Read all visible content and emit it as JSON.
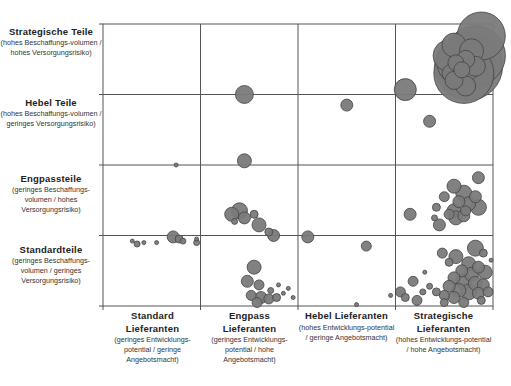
{
  "chart_data": {
    "type": "scatter",
    "subtype": "bubble-portfolio-matrix",
    "title": "",
    "xlabel": "Lieferanten-Portfolio (Entwicklungspotential / Angebotsmacht)",
    "ylabel": "Teile-Portfolio (Beschaffungsvolumen / Versorgungsrisiko)",
    "grid": true,
    "x_categories": [
      {
        "title": "Standard Lieferanten",
        "subtitle": "(geringes Entwicklungs-potential / geringe Angebotsmacht)"
      },
      {
        "title": "Engpass Lieferanten",
        "subtitle": "(geringes Entwicklungs-potential / hohe Angebotsmacht)"
      },
      {
        "title": "Hebel Lieferanten",
        "subtitle": "(hohes Entwicklungs-potential / geringe Angebotsmacht)"
      },
      {
        "title": "Strategische Lieferanten",
        "subtitle": "(hohes Entwicklungs-potential / hohe Angebotsmacht)"
      }
    ],
    "y_categories": [
      {
        "title": "Strategische Teile",
        "subtitle": "(hohes Beschaffungs-volumen / hohes Versorgungsrisiko)"
      },
      {
        "title": "Hebel Teile",
        "subtitle": "(hohes Beschaffungs-volumen / geringes Versorgungsrisiko)"
      },
      {
        "title": "Engpassteile",
        "subtitle": "(geringes Beschaffungs-volumen / hohes Versorgungsrisiko)"
      },
      {
        "title": "Standardteile",
        "subtitle": "(geringes Beschaffungs-volumen / geringes Versorgungsrisiko)"
      }
    ],
    "xlim": [
      0,
      4
    ],
    "ylim": [
      0,
      4
    ],
    "bubble_color": "#7a7a7a",
    "bubble_stroke": "#444444",
    "note": "x,y in plot units (0-4, each cell = 1 unit; y=4 top). r = radius in px.",
    "points": [
      {
        "x": 3.88,
        "y": 3.83,
        "r": 24
      },
      {
        "x": 3.82,
        "y": 3.55,
        "r": 30
      },
      {
        "x": 3.75,
        "y": 3.4,
        "r": 34
      },
      {
        "x": 3.7,
        "y": 3.3,
        "r": 30
      },
      {
        "x": 3.65,
        "y": 3.45,
        "r": 22
      },
      {
        "x": 3.55,
        "y": 3.55,
        "r": 16
      },
      {
        "x": 3.6,
        "y": 3.7,
        "r": 12
      },
      {
        "x": 3.78,
        "y": 3.62,
        "r": 12
      },
      {
        "x": 3.72,
        "y": 3.5,
        "r": 9
      },
      {
        "x": 3.62,
        "y": 3.45,
        "r": 8
      },
      {
        "x": 3.68,
        "y": 3.35,
        "r": 8
      },
      {
        "x": 3.57,
        "y": 3.3,
        "r": 9
      },
      {
        "x": 3.82,
        "y": 3.4,
        "r": 10
      },
      {
        "x": 3.6,
        "y": 3.2,
        "r": 9
      },
      {
        "x": 3.72,
        "y": 3.12,
        "r": 10
      },
      {
        "x": 3.1,
        "y": 3.07,
        "r": 11
      },
      {
        "x": 1.45,
        "y": 3.0,
        "r": 9
      },
      {
        "x": 2.5,
        "y": 2.85,
        "r": 6
      },
      {
        "x": 3.35,
        "y": 2.62,
        "r": 6
      },
      {
        "x": 0.75,
        "y": 2.0,
        "r": 2
      },
      {
        "x": 1.45,
        "y": 2.06,
        "r": 7
      },
      {
        "x": 3.85,
        "y": 1.82,
        "r": 6
      },
      {
        "x": 3.6,
        "y": 1.7,
        "r": 7
      },
      {
        "x": 3.7,
        "y": 1.6,
        "r": 8
      },
      {
        "x": 3.82,
        "y": 1.55,
        "r": 6
      },
      {
        "x": 3.65,
        "y": 1.48,
        "r": 6
      },
      {
        "x": 3.75,
        "y": 1.45,
        "r": 7
      },
      {
        "x": 3.85,
        "y": 1.4,
        "r": 8
      },
      {
        "x": 3.6,
        "y": 1.35,
        "r": 7
      },
      {
        "x": 3.72,
        "y": 1.35,
        "r": 5
      },
      {
        "x": 3.5,
        "y": 1.55,
        "r": 5
      },
      {
        "x": 3.42,
        "y": 1.4,
        "r": 4
      },
      {
        "x": 3.55,
        "y": 1.3,
        "r": 5
      },
      {
        "x": 3.62,
        "y": 1.25,
        "r": 7
      },
      {
        "x": 3.7,
        "y": 1.28,
        "r": 6
      },
      {
        "x": 3.4,
        "y": 1.25,
        "r": 3
      },
      {
        "x": 3.45,
        "y": 1.15,
        "r": 6
      },
      {
        "x": 3.15,
        "y": 1.3,
        "r": 6
      },
      {
        "x": 1.32,
        "y": 1.3,
        "r": 7
      },
      {
        "x": 1.4,
        "y": 1.35,
        "r": 8
      },
      {
        "x": 1.35,
        "y": 1.2,
        "r": 3
      },
      {
        "x": 1.45,
        "y": 1.25,
        "r": 6
      },
      {
        "x": 1.55,
        "y": 1.3,
        "r": 4
      },
      {
        "x": 1.6,
        "y": 1.15,
        "r": 7
      },
      {
        "x": 1.7,
        "y": 1.05,
        "r": 4
      },
      {
        "x": 1.75,
        "y": 1.0,
        "r": 6
      },
      {
        "x": 2.1,
        "y": 0.98,
        "r": 6
      },
      {
        "x": 2.7,
        "y": 0.85,
        "r": 5
      },
      {
        "x": 0.3,
        "y": 0.92,
        "r": 2
      },
      {
        "x": 0.35,
        "y": 0.88,
        "r": 3
      },
      {
        "x": 0.42,
        "y": 0.9,
        "r": 2
      },
      {
        "x": 0.55,
        "y": 0.9,
        "r": 2
      },
      {
        "x": 0.72,
        "y": 0.98,
        "r": 6
      },
      {
        "x": 0.78,
        "y": 0.95,
        "r": 4
      },
      {
        "x": 0.82,
        "y": 0.92,
        "r": 3
      },
      {
        "x": 0.96,
        "y": 0.9,
        "r": 3
      },
      {
        "x": 0.96,
        "y": 0.95,
        "r": 2
      },
      {
        "x": 1.55,
        "y": 0.55,
        "r": 7
      },
      {
        "x": 1.48,
        "y": 0.35,
        "r": 6
      },
      {
        "x": 1.6,
        "y": 0.3,
        "r": 5
      },
      {
        "x": 1.52,
        "y": 0.15,
        "r": 5
      },
      {
        "x": 1.62,
        "y": 0.12,
        "r": 6
      },
      {
        "x": 1.7,
        "y": 0.1,
        "r": 5
      },
      {
        "x": 1.78,
        "y": 0.12,
        "r": 4
      },
      {
        "x": 1.58,
        "y": 0.05,
        "r": 5
      },
      {
        "x": 1.72,
        "y": 0.22,
        "r": 3
      },
      {
        "x": 1.85,
        "y": 0.18,
        "r": 2
      },
      {
        "x": 1.9,
        "y": 0.25,
        "r": 2
      },
      {
        "x": 1.8,
        "y": 0.3,
        "r": 2
      },
      {
        "x": 1.95,
        "y": 0.12,
        "r": 2
      },
      {
        "x": 2.6,
        "y": 0.02,
        "r": 2
      },
      {
        "x": 3.82,
        "y": 0.82,
        "r": 8
      },
      {
        "x": 3.9,
        "y": 0.75,
        "r": 4
      },
      {
        "x": 3.62,
        "y": 0.7,
        "r": 7
      },
      {
        "x": 3.75,
        "y": 0.6,
        "r": 7
      },
      {
        "x": 3.85,
        "y": 0.55,
        "r": 6
      },
      {
        "x": 3.92,
        "y": 0.48,
        "r": 7
      },
      {
        "x": 3.68,
        "y": 0.5,
        "r": 6
      },
      {
        "x": 3.78,
        "y": 0.45,
        "r": 7
      },
      {
        "x": 3.6,
        "y": 0.4,
        "r": 6
      },
      {
        "x": 3.7,
        "y": 0.35,
        "r": 8
      },
      {
        "x": 3.82,
        "y": 0.32,
        "r": 7
      },
      {
        "x": 3.9,
        "y": 0.3,
        "r": 6
      },
      {
        "x": 3.55,
        "y": 0.28,
        "r": 6
      },
      {
        "x": 3.65,
        "y": 0.22,
        "r": 7
      },
      {
        "x": 3.75,
        "y": 0.2,
        "r": 8
      },
      {
        "x": 3.85,
        "y": 0.18,
        "r": 6
      },
      {
        "x": 3.95,
        "y": 0.2,
        "r": 5
      },
      {
        "x": 3.6,
        "y": 0.12,
        "r": 6
      },
      {
        "x": 3.5,
        "y": 0.15,
        "r": 5
      },
      {
        "x": 3.42,
        "y": 0.2,
        "r": 4
      },
      {
        "x": 3.35,
        "y": 0.28,
        "r": 3
      },
      {
        "x": 3.28,
        "y": 0.2,
        "r": 3
      },
      {
        "x": 3.22,
        "y": 0.08,
        "r": 5
      },
      {
        "x": 3.1,
        "y": 0.12,
        "r": 4
      },
      {
        "x": 3.05,
        "y": 0.2,
        "r": 5
      },
      {
        "x": 3.18,
        "y": 0.35,
        "r": 5
      },
      {
        "x": 3.5,
        "y": 0.05,
        "r": 4
      },
      {
        "x": 3.7,
        "y": 0.05,
        "r": 5
      },
      {
        "x": 3.88,
        "y": 0.08,
        "r": 4
      },
      {
        "x": 3.48,
        "y": 0.75,
        "r": 5
      },
      {
        "x": 3.55,
        "y": 0.62,
        "r": 4
      },
      {
        "x": 3.98,
        "y": 0.65,
        "r": 2
      },
      {
        "x": 3.3,
        "y": 0.48,
        "r": 2
      },
      {
        "x": 2.95,
        "y": 0.15,
        "r": 2
      }
    ]
  }
}
